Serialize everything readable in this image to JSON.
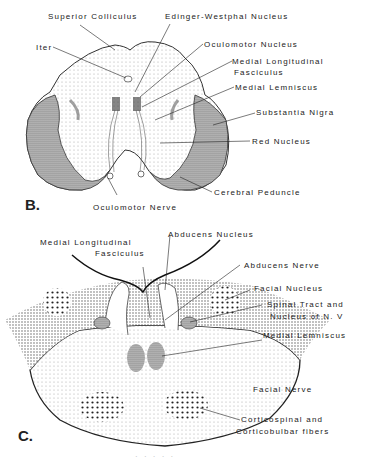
{
  "panel_b": {
    "label": "B.",
    "structures": {
      "superior_colliculus": "Superior Colliculus",
      "edinger_westphal": "Edinger-Westphal Nucleus",
      "iter": "Iter",
      "oculomotor_nucleus": "Oculomotor Nucleus",
      "mlf_line1": "Medial Longitudinal",
      "mlf_line2": "Fasciculus",
      "medial_lemniscus": "Medial Lemniscus",
      "substantia_nigra": "Substantia Nigra",
      "red_nucleus": "Red Nucleus",
      "cerebral_peduncle": "Cerebral Peduncle",
      "oculomotor_nerve": "Oculomotor Nerve"
    }
  },
  "panel_c": {
    "label": "C.",
    "structures": {
      "mlf_line1": "Medial Longitudinal",
      "mlf_line2": "Fasciculus",
      "abducens_nucleus": "Abducens  Nucleus",
      "abducens_nerve": "Abducens Nerve",
      "facial_nucleus": "Facial Nucleus",
      "spinal_tract_line1": "Spinal Tract  and",
      "spinal_tract_line2": "Nucleus  of  N. V",
      "medial_lemniscus": "Medial Lemniscus",
      "facial_nerve": "Facial Nerve",
      "corticospinal_line1": "Corticospinal  and",
      "corticospinal_line2": "Corticobulbar fibers"
    }
  },
  "caption": "· · · · ·"
}
